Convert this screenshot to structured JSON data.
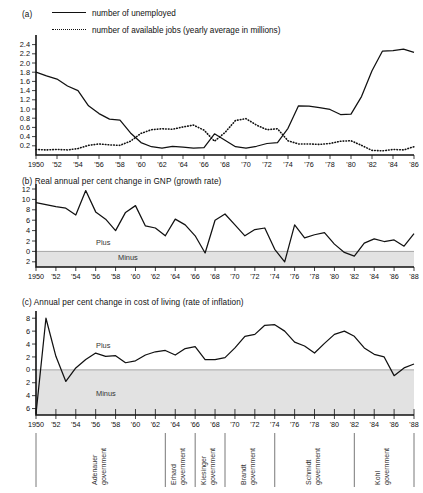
{
  "chart_data": [
    {
      "type": "line",
      "panel": "a",
      "panel_label": "(a)",
      "title": "",
      "xlabel": "",
      "ylabel": "",
      "unit_note": "yearly average in millions",
      "ylim": [
        0,
        2.5
      ],
      "yticks": [
        0.2,
        0.4,
        0.6,
        0.8,
        1.0,
        1.2,
        1.4,
        1.6,
        1.8,
        2.0,
        2.2,
        2.4
      ],
      "ytick_labels": [
        "0.2",
        "0.4",
        "0.6",
        "0.8",
        "1.0",
        "1.2",
        "1.4",
        "1.6",
        "1.8",
        "2.0",
        "2.2",
        "2.4"
      ],
      "xlim": [
        1950,
        1986
      ],
      "x": [
        1950,
        1951,
        1952,
        1953,
        1954,
        1955,
        1956,
        1957,
        1958,
        1959,
        1960,
        1961,
        1962,
        1963,
        1964,
        1965,
        1966,
        1967,
        1968,
        1969,
        1970,
        1971,
        1972,
        1973,
        1974,
        1975,
        1976,
        1977,
        1978,
        1979,
        1980,
        1981,
        1982,
        1983,
        1984,
        1985,
        1986
      ],
      "xtick_labels": [
        "1950",
        "'52",
        "'54",
        "'56",
        "'58",
        "'60",
        "'62",
        "'64",
        "'66",
        "'68",
        "'70",
        "'72",
        "'74",
        "'76",
        "'78",
        "'80",
        "'82",
        "'84",
        "'86"
      ],
      "grid": false,
      "legend_position": "top",
      "series": [
        {
          "name": "number of unemployed",
          "style": "solid",
          "values": [
            1.8,
            1.72,
            1.65,
            1.5,
            1.4,
            1.07,
            0.9,
            0.78,
            0.76,
            0.48,
            0.27,
            0.18,
            0.15,
            0.19,
            0.17,
            0.15,
            0.16,
            0.46,
            0.32,
            0.18,
            0.15,
            0.19,
            0.25,
            0.27,
            0.58,
            1.07,
            1.06,
            1.03,
            0.99,
            0.88,
            0.89,
            1.27,
            1.83,
            2.26,
            2.27,
            2.3,
            2.23
          ]
        },
        {
          "name": "number of available jobs (yearly average in millions)",
          "style": "dotted",
          "values": [
            0.12,
            0.11,
            0.12,
            0.11,
            0.14,
            0.21,
            0.24,
            0.22,
            0.21,
            0.3,
            0.47,
            0.55,
            0.57,
            0.56,
            0.61,
            0.65,
            0.54,
            0.3,
            0.49,
            0.75,
            0.79,
            0.65,
            0.55,
            0.57,
            0.31,
            0.24,
            0.24,
            0.23,
            0.25,
            0.3,
            0.31,
            0.21,
            0.1,
            0.09,
            0.12,
            0.11,
            0.18
          ]
        }
      ]
    },
    {
      "type": "line",
      "panel": "b",
      "panel_label": "(b)",
      "title": "Real annual per cent change in GNP (growth rate)",
      "xlabel": "",
      "ylabel": "",
      "ylim": [
        -3,
        12
      ],
      "yticks": [
        12,
        10,
        8,
        6,
        4,
        2,
        0,
        -2
      ],
      "ytick_labels": [
        "12",
        "10",
        "8",
        "6",
        "4",
        "2",
        "0",
        "2"
      ],
      "xlim": [
        1950,
        1988
      ],
      "x": [
        1950,
        1951,
        1952,
        1953,
        1954,
        1955,
        1956,
        1957,
        1958,
        1959,
        1960,
        1961,
        1962,
        1963,
        1964,
        1965,
        1966,
        1967,
        1968,
        1969,
        1970,
        1971,
        1972,
        1973,
        1974,
        1975,
        1976,
        1977,
        1978,
        1979,
        1980,
        1981,
        1982,
        1983,
        1984,
        1985,
        1986,
        1987,
        1988
      ],
      "xtick_labels": [
        "1950",
        "'52",
        "'54",
        "'56",
        "'58",
        "'60",
        "'62",
        "'64",
        "'66",
        "'68",
        "'70",
        "'72",
        "'74",
        "'76",
        "'78",
        "'80",
        "'82",
        "'84",
        "'86",
        "'88"
      ],
      "grid": false,
      "band_labels": {
        "positive": "Plus",
        "negative": "Minus"
      },
      "values": [
        9.4,
        9.0,
        8.6,
        8.3,
        7.0,
        11.7,
        7.6,
        6.2,
        4.0,
        7.5,
        8.8,
        4.9,
        4.5,
        3.0,
        6.2,
        5.1,
        3.0,
        -0.3,
        6.0,
        7.2,
        5.1,
        3.0,
        4.2,
        4.5,
        0.4,
        -2.0,
        5.1,
        2.6,
        3.2,
        3.6,
        1.4,
        -0.2,
        -0.9,
        1.6,
        2.4,
        1.9,
        2.2,
        1.0,
        3.4
      ]
    },
    {
      "type": "line",
      "panel": "c",
      "panel_label": "(c)",
      "title": "Annual per cent change in cost of living (rate of inflation)",
      "xlabel": "",
      "ylabel": "",
      "ylim": [
        -7,
        8.5
      ],
      "yticks": [
        8,
        6,
        4,
        2,
        0,
        -2,
        -4,
        -6
      ],
      "ytick_labels": [
        "8",
        "6",
        "4",
        "2",
        "0",
        "2",
        "4",
        "6"
      ],
      "xlim": [
        1950,
        1988
      ],
      "x": [
        1950,
        1951,
        1952,
        1953,
        1954,
        1955,
        1956,
        1957,
        1958,
        1959,
        1960,
        1961,
        1962,
        1963,
        1964,
        1965,
        1966,
        1967,
        1968,
        1969,
        1970,
        1971,
        1972,
        1973,
        1974,
        1975,
        1976,
        1977,
        1978,
        1979,
        1980,
        1981,
        1982,
        1983,
        1984,
        1985,
        1986,
        1987,
        1988
      ],
      "xtick_labels": [
        "1950",
        "'52",
        "'54",
        "'56",
        "'58",
        "'60",
        "'62",
        "'64",
        "'66",
        "'68",
        "'70",
        "'72",
        "'74",
        "'76",
        "'78",
        "'80",
        "'82",
        "'84",
        "'86",
        "'88"
      ],
      "grid": false,
      "band_labels": {
        "positive": "Plus",
        "negative": "Minus"
      },
      "values": [
        -6.8,
        8.0,
        2.1,
        -1.8,
        0.3,
        1.6,
        2.6,
        2.1,
        2.2,
        1.1,
        1.4,
        2.3,
        2.8,
        3.0,
        2.3,
        3.3,
        3.6,
        1.6,
        1.6,
        1.9,
        3.4,
        5.2,
        5.5,
        6.9,
        7.0,
        6.0,
        4.3,
        3.7,
        2.6,
        4.1,
        5.5,
        6.0,
        5.2,
        3.4,
        2.4,
        2.0,
        -0.9,
        0.3,
        0.9
      ]
    }
  ],
  "panel_a": {
    "label": "(a)",
    "legend": [
      {
        "label": "number of unemployed",
        "style": "solid"
      },
      {
        "label": "number of available jobs (yearly average in millions)",
        "style": "dotted"
      }
    ]
  },
  "panel_b": {
    "label": "(b)",
    "title": "Real annual per cent change in GNP (growth rate)",
    "plus": "Plus",
    "minus": "Minus"
  },
  "panel_c": {
    "label": "(c)",
    "title": "Annual per cent change in cost of living (rate of inflation)",
    "plus": "Plus",
    "minus": "Minus"
  },
  "governments": [
    {
      "name": "Adenauer government",
      "start": 1950,
      "end": 1963
    },
    {
      "name": "Erhard government",
      "start": 1963,
      "end": 1966
    },
    {
      "name": "Kiesinger government",
      "start": 1966,
      "end": 1969
    },
    {
      "name": "Brandt government",
      "start": 1969,
      "end": 1974
    },
    {
      "name": "Schmidt government",
      "start": 1974,
      "end": 1982
    },
    {
      "name": "Kohl government",
      "start": 1982,
      "end": 1988
    }
  ],
  "colors": {
    "line": "#111111",
    "minus_band": "#e2e2e2",
    "axis": "#111111",
    "gov_rule": "#555555"
  }
}
